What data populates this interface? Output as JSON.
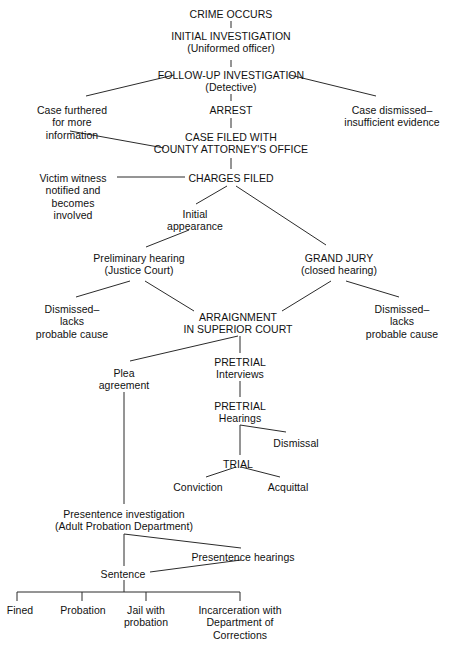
{
  "diagram": {
    "line_color": "#2b2b2b",
    "text_color": "#111111",
    "background": "#ffffff",
    "nodes": [
      {
        "id": "crime_occurs",
        "text": "CRIME OCCURS",
        "x": 231,
        "y": 8,
        "lines": 1
      },
      {
        "id": "initial_investigation",
        "text": "INITIAL INVESTIGATION\n(Uniformed officer)",
        "x": 231,
        "y": 30,
        "lines": 2
      },
      {
        "id": "follow_up",
        "text": "FOLLOW-UP INVESTIGATION\n(Detective)",
        "x": 231,
        "y": 69,
        "lines": 2
      },
      {
        "id": "case_furthered",
        "text": "Case furthered\nfor more\ninformation",
        "x": 72,
        "y": 104,
        "lines": 3
      },
      {
        "id": "case_dismissed",
        "text": "Case dismissed–\ninsufficient evidence",
        "x": 392,
        "y": 104,
        "lines": 2
      },
      {
        "id": "arrest",
        "text": "ARREST",
        "x": 231,
        "y": 104,
        "lines": 1
      },
      {
        "id": "case_filed",
        "text": "CASE FILED WITH\nCOUNTY ATTORNEY'S OFFICE",
        "x": 231,
        "y": 131,
        "lines": 2
      },
      {
        "id": "victim_witness",
        "text": "Victim witness\nnotified and\nbecomes\ninvolved",
        "x": 73,
        "y": 172,
        "lines": 4
      },
      {
        "id": "charges_filed",
        "text": "CHARGES FILED",
        "x": 231,
        "y": 172,
        "lines": 1
      },
      {
        "id": "initial_appearance",
        "text": "Initial\nappearance",
        "x": 195,
        "y": 208,
        "lines": 2
      },
      {
        "id": "preliminary_hearing",
        "text": "Preliminary hearing\n(Justice Court)",
        "x": 139,
        "y": 252,
        "lines": 2
      },
      {
        "id": "grand_jury",
        "text": "GRAND JURY\n(closed hearing)",
        "x": 339,
        "y": 252,
        "lines": 2
      },
      {
        "id": "dismissed_left",
        "text": "Dismissed–\nlacks\nprobable cause",
        "x": 72,
        "y": 303,
        "lines": 3
      },
      {
        "id": "dismissed_right",
        "text": "Dismissed–\nlacks\nprobable cause",
        "x": 402,
        "y": 303,
        "lines": 3
      },
      {
        "id": "arraignment",
        "text": "ARRAIGNMENT\nIN SUPERIOR COURT",
        "x": 238,
        "y": 311,
        "lines": 2
      },
      {
        "id": "pretrial_interviews",
        "text": "PRETRIAL\nInterviews",
        "x": 240,
        "y": 356,
        "lines": 2
      },
      {
        "id": "plea_agreement",
        "text": "Plea\nagreement",
        "x": 124,
        "y": 367,
        "lines": 2
      },
      {
        "id": "pretrial_hearings",
        "text": "PRETRIAL\nHearings",
        "x": 240,
        "y": 400,
        "lines": 2
      },
      {
        "id": "dismissal",
        "text": "Dismissal",
        "x": 296,
        "y": 437,
        "lines": 1
      },
      {
        "id": "trial",
        "text": "TRIAL",
        "x": 238,
        "y": 458,
        "lines": 1
      },
      {
        "id": "conviction",
        "text": "Conviction",
        "x": 198,
        "y": 481,
        "lines": 1
      },
      {
        "id": "acquittal",
        "text": "Acquittal",
        "x": 288,
        "y": 481,
        "lines": 1
      },
      {
        "id": "presentence_invest",
        "text": "Presentence investigation\n(Adult Probation Department)",
        "x": 124,
        "y": 508,
        "lines": 2
      },
      {
        "id": "presentence_hearings",
        "text": "Presentence hearings",
        "x": 243,
        "y": 551,
        "lines": 1
      },
      {
        "id": "sentence",
        "text": "Sentence",
        "x": 123,
        "y": 568,
        "lines": 1
      },
      {
        "id": "fined",
        "text": "Fined",
        "x": 20,
        "y": 604,
        "lines": 1
      },
      {
        "id": "probation",
        "text": "Probation",
        "x": 83,
        "y": 604,
        "lines": 1
      },
      {
        "id": "jail_with_probation",
        "text": "Jail with\nprobation",
        "x": 146,
        "y": 604,
        "lines": 2
      },
      {
        "id": "incarceration",
        "text": "Incarceration with\nDepartment of\nCorrections",
        "x": 240,
        "y": 604,
        "lines": 3
      }
    ],
    "edges": [
      {
        "id": "crime-to-initial",
        "x1": 231,
        "y1": 21,
        "x2": 231,
        "y2": 28
      },
      {
        "id": "initial-to-followup",
        "x1": 231,
        "y1": 60,
        "x2": 231,
        "y2": 67
      },
      {
        "id": "followup-to-case-furthered",
        "x1": 174,
        "y1": 75,
        "x2": 86,
        "y2": 96
      },
      {
        "id": "followup-to-case-dismissed",
        "x1": 290,
        "y1": 75,
        "x2": 376,
        "y2": 96
      },
      {
        "id": "followup-to-arrest",
        "x1": 231,
        "y1": 94,
        "x2": 231,
        "y2": 101
      },
      {
        "id": "arrest-to-case-filed",
        "x1": 231,
        "y1": 118,
        "x2": 231,
        "y2": 128
      },
      {
        "id": "case-furthered-to-case-filed",
        "x1": 70,
        "y1": 131,
        "x2": 164,
        "y2": 148
      },
      {
        "id": "case-filed-to-charges-filed",
        "x1": 231,
        "y1": 158,
        "x2": 231,
        "y2": 169
      },
      {
        "id": "victim-witness-to-charges",
        "x1": 117,
        "y1": 177,
        "x2": 185,
        "y2": 177
      },
      {
        "id": "charges-to-initial-appearance",
        "x1": 227,
        "y1": 186,
        "x2": 196,
        "y2": 204
      },
      {
        "id": "charges-to-grand-jury",
        "x1": 236,
        "y1": 186,
        "x2": 326,
        "y2": 245
      },
      {
        "id": "initial-appearance-to-prelim",
        "x1": 189,
        "y1": 230,
        "x2": 146,
        "y2": 247
      },
      {
        "id": "prelim-to-dismissed-left",
        "x1": 130,
        "y1": 281,
        "x2": 76,
        "y2": 297
      },
      {
        "id": "prelim-to-arraignment",
        "x1": 145,
        "y1": 281,
        "x2": 194,
        "y2": 311
      },
      {
        "id": "grand-jury-to-arraignment",
        "x1": 331,
        "y1": 281,
        "x2": 282,
        "y2": 311
      },
      {
        "id": "grand-jury-to-dismissed-right",
        "x1": 346,
        "y1": 281,
        "x2": 399,
        "y2": 297
      },
      {
        "id": "arraignment-to-pretrial",
        "x1": 240,
        "y1": 336,
        "x2": 240,
        "y2": 353
      },
      {
        "id": "arraignment-to-plea",
        "x1": 238,
        "y1": 336,
        "x2": 130,
        "y2": 361
      },
      {
        "id": "pretrial-int-to-pretrial-hear",
        "x1": 240,
        "y1": 381,
        "x2": 240,
        "y2": 397
      },
      {
        "id": "pretrial-hear-to-trial",
        "x1": 240,
        "y1": 425,
        "x2": 240,
        "y2": 455
      },
      {
        "id": "pretrial-hear-to-dismissal",
        "x1": 240,
        "y1": 425,
        "x2": 286,
        "y2": 432
      },
      {
        "id": "trial-to-conviction",
        "x1": 236,
        "y1": 467,
        "x2": 206,
        "y2": 477
      },
      {
        "id": "trial-to-acquittal",
        "x1": 241,
        "y1": 467,
        "x2": 280,
        "y2": 477
      },
      {
        "id": "plea-to-presentence",
        "x1": 124,
        "y1": 392,
        "x2": 124,
        "y2": 504
      },
      {
        "id": "presentence-to-sentence",
        "x1": 124,
        "y1": 534,
        "x2": 124,
        "y2": 566
      },
      {
        "id": "presentence-to-hearings",
        "x1": 124,
        "y1": 534,
        "x2": 241,
        "y2": 548
      },
      {
        "id": "hearings-to-sentence",
        "x1": 241,
        "y1": 560,
        "x2": 150,
        "y2": 572
      },
      {
        "id": "sentence-to-bracket",
        "x1": 124,
        "y1": 580,
        "x2": 124,
        "y2": 592
      },
      {
        "id": "bracket-horizontal",
        "x1": 17,
        "y1": 592,
        "x2": 240,
        "y2": 592
      },
      {
        "id": "bracket-tick-fined",
        "x1": 17,
        "y1": 592,
        "x2": 17,
        "y2": 601
      },
      {
        "id": "bracket-tick-probation",
        "x1": 82,
        "y1": 592,
        "x2": 82,
        "y2": 601
      },
      {
        "id": "bracket-tick-jail",
        "x1": 146,
        "y1": 592,
        "x2": 146,
        "y2": 601
      },
      {
        "id": "bracket-tick-incarceration",
        "x1": 240,
        "y1": 592,
        "x2": 240,
        "y2": 601
      }
    ]
  }
}
